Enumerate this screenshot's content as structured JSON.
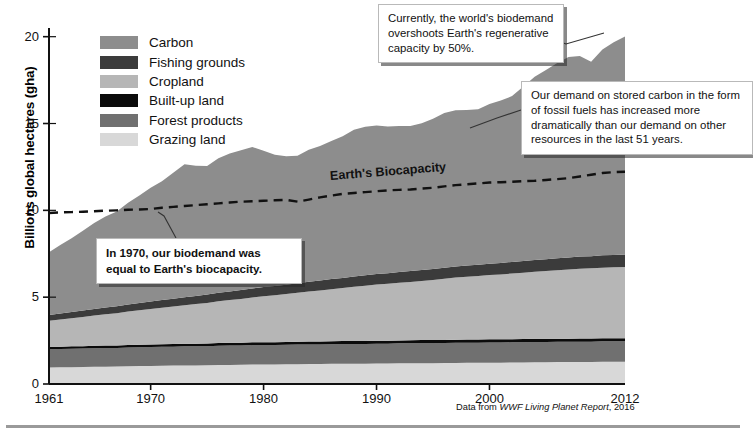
{
  "figure": {
    "ylabel": "Billions global hectares (gha)",
    "source_prefix": "Data from ",
    "source_italic": "WWF Living Planet Report",
    "source_suffix": ", 2016",
    "biocapacity_label": "Earth's Biocapacity"
  },
  "legend": {
    "items": [
      {
        "label": "Carbon",
        "color": "#8d8d8d"
      },
      {
        "label": "Fishing grounds",
        "color": "#3b3b3b"
      },
      {
        "label": "Cropland",
        "color": "#b6b6b6"
      },
      {
        "label": "Built-up land",
        "color": "#0b0b0b"
      },
      {
        "label": "Forest products",
        "color": "#707070"
      },
      {
        "label": "Grazing land",
        "color": "#d8d8d8"
      }
    ]
  },
  "callouts": [
    {
      "id": "overshoot",
      "text": "Currently, the world's biodemand overshoots Earth's regenerative capacity by 50%."
    },
    {
      "id": "carbon",
      "text": "Our demand on stored carbon in the form of fossil fuels has increased more dramatically than our demand on other resources in the last 51 years."
    },
    {
      "id": "y1970",
      "text": "In 1970, our biodemand was equal to Earth's biocapacity."
    }
  ],
  "chart_data": {
    "type": "area",
    "title": "",
    "xlabel": "",
    "ylabel": "Billions global hectares (gha)",
    "xlim": [
      1961,
      2012
    ],
    "ylim": [
      0,
      20.5
    ],
    "yticks": [
      0,
      5,
      10,
      15,
      20
    ],
    "xticks": [
      1961,
      1970,
      1980,
      1990,
      2000,
      2012
    ],
    "grid": false,
    "legend_position": "upper-left-inside",
    "stacked": true,
    "stack_order_bottom_to_top": [
      "Grazing land",
      "Forest products",
      "Built-up land",
      "Cropland",
      "Fishing grounds",
      "Carbon"
    ],
    "x": [
      1961,
      1962,
      1963,
      1964,
      1965,
      1966,
      1967,
      1968,
      1969,
      1970,
      1971,
      1972,
      1973,
      1974,
      1975,
      1976,
      1977,
      1978,
      1979,
      1980,
      1981,
      1982,
      1983,
      1984,
      1985,
      1986,
      1987,
      1988,
      1989,
      1990,
      1991,
      1992,
      1993,
      1994,
      1995,
      1996,
      1997,
      1998,
      1999,
      2000,
      2001,
      2002,
      2003,
      2004,
      2005,
      2006,
      2007,
      2008,
      2009,
      2010,
      2011,
      2012
    ],
    "series": [
      {
        "name": "Grazing land",
        "color": "#d8d8d8",
        "values": [
          0.95,
          0.96,
          0.97,
          0.98,
          0.99,
          1.0,
          1.01,
          1.02,
          1.03,
          1.04,
          1.05,
          1.06,
          1.07,
          1.07,
          1.08,
          1.09,
          1.1,
          1.11,
          1.12,
          1.13,
          1.13,
          1.14,
          1.14,
          1.15,
          1.15,
          1.16,
          1.16,
          1.17,
          1.17,
          1.18,
          1.18,
          1.19,
          1.19,
          1.2,
          1.2,
          1.21,
          1.21,
          1.22,
          1.22,
          1.23,
          1.23,
          1.24,
          1.24,
          1.25,
          1.25,
          1.26,
          1.26,
          1.27,
          1.27,
          1.28,
          1.28,
          1.28
        ]
      },
      {
        "name": "Forest products",
        "color": "#707070",
        "values": [
          1.05,
          1.05,
          1.06,
          1.06,
          1.07,
          1.07,
          1.07,
          1.08,
          1.08,
          1.09,
          1.09,
          1.09,
          1.1,
          1.1,
          1.1,
          1.11,
          1.11,
          1.11,
          1.12,
          1.12,
          1.12,
          1.12,
          1.13,
          1.13,
          1.13,
          1.13,
          1.14,
          1.14,
          1.14,
          1.14,
          1.14,
          1.15,
          1.15,
          1.15,
          1.15,
          1.15,
          1.16,
          1.16,
          1.16,
          1.16,
          1.16,
          1.16,
          1.17,
          1.17,
          1.17,
          1.17,
          1.17,
          1.17,
          1.17,
          1.18,
          1.18,
          1.18
        ]
      },
      {
        "name": "Built-up land",
        "color": "#0b0b0b",
        "values": [
          0.14,
          0.14,
          0.14,
          0.14,
          0.14,
          0.14,
          0.14,
          0.15,
          0.15,
          0.15,
          0.15,
          0.15,
          0.15,
          0.15,
          0.15,
          0.16,
          0.16,
          0.16,
          0.16,
          0.16,
          0.16,
          0.16,
          0.16,
          0.17,
          0.17,
          0.17,
          0.17,
          0.17,
          0.17,
          0.17,
          0.17,
          0.17,
          0.18,
          0.18,
          0.18,
          0.18,
          0.18,
          0.18,
          0.18,
          0.18,
          0.18,
          0.18,
          0.18,
          0.18,
          0.18,
          0.18,
          0.18,
          0.18,
          0.18,
          0.18,
          0.18,
          0.18
        ]
      },
      {
        "name": "Cropland",
        "color": "#b6b6b6",
        "values": [
          1.5,
          1.56,
          1.62,
          1.68,
          1.74,
          1.8,
          1.86,
          1.92,
          1.98,
          2.04,
          2.1,
          2.16,
          2.22,
          2.28,
          2.34,
          2.4,
          2.46,
          2.52,
          2.58,
          2.64,
          2.7,
          2.76,
          2.82,
          2.88,
          2.94,
          3.0,
          3.06,
          3.12,
          3.18,
          3.24,
          3.28,
          3.32,
          3.36,
          3.4,
          3.46,
          3.52,
          3.58,
          3.62,
          3.66,
          3.7,
          3.74,
          3.78,
          3.82,
          3.86,
          3.9,
          3.94,
          3.98,
          4.02,
          4.04,
          4.06,
          4.08,
          4.1
        ]
      },
      {
        "name": "Fishing grounds",
        "color": "#3b3b3b",
        "values": [
          0.34,
          0.35,
          0.36,
          0.37,
          0.38,
          0.39,
          0.4,
          0.41,
          0.42,
          0.43,
          0.44,
          0.45,
          0.46,
          0.47,
          0.48,
          0.49,
          0.5,
          0.51,
          0.52,
          0.53,
          0.54,
          0.54,
          0.55,
          0.56,
          0.57,
          0.58,
          0.58,
          0.59,
          0.6,
          0.61,
          0.61,
          0.62,
          0.62,
          0.63,
          0.63,
          0.64,
          0.64,
          0.65,
          0.65,
          0.66,
          0.66,
          0.67,
          0.67,
          0.68,
          0.68,
          0.69,
          0.69,
          0.7,
          0.7,
          0.71,
          0.71,
          0.72
        ]
      },
      {
        "name": "Carbon",
        "color": "#8d8d8d",
        "values": [
          3.6,
          3.95,
          4.25,
          4.6,
          4.95,
          5.25,
          5.45,
          5.85,
          6.2,
          6.55,
          6.85,
          7.25,
          7.65,
          7.5,
          7.4,
          7.75,
          7.95,
          8.05,
          8.15,
          7.85,
          7.55,
          7.4,
          7.35,
          7.6,
          7.75,
          7.95,
          8.15,
          8.45,
          8.55,
          8.55,
          8.45,
          8.4,
          8.35,
          8.45,
          8.65,
          8.9,
          9.0,
          8.95,
          8.95,
          9.2,
          9.35,
          9.55,
          10.05,
          10.55,
          10.9,
          11.25,
          11.55,
          11.55,
          11.2,
          11.85,
          12.25,
          12.55
        ]
      }
    ],
    "reference_line": {
      "name": "Earth's Biocapacity",
      "style": "dashed",
      "color": "#111111",
      "values": [
        9.85,
        9.88,
        9.9,
        9.92,
        9.95,
        9.98,
        10.0,
        10.03,
        10.05,
        10.08,
        10.15,
        10.2,
        10.25,
        10.3,
        10.35,
        10.4,
        10.45,
        10.5,
        10.52,
        10.55,
        10.58,
        10.6,
        10.5,
        10.62,
        10.75,
        10.85,
        10.95,
        11.0,
        11.05,
        11.1,
        11.15,
        11.18,
        11.2,
        11.25,
        11.3,
        11.38,
        11.45,
        11.5,
        11.55,
        11.6,
        11.62,
        11.65,
        11.68,
        11.7,
        11.75,
        11.8,
        11.85,
        11.95,
        12.05,
        12.15,
        12.2,
        12.22
      ]
    }
  }
}
